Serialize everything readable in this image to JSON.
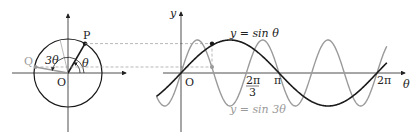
{
  "figure": {
    "circle": {
      "center": [
        68,
        73
      ],
      "radius": 34,
      "labels": {
        "P": "P",
        "Q": "Q",
        "O": "O",
        "theta": "θ",
        "three_theta": "3θ"
      }
    },
    "graph": {
      "origin": [
        181,
        73
      ],
      "x_scale_pi": 98,
      "amplitude": 33,
      "axis_labels": {
        "y": "y",
        "x": "θ",
        "origin": "O"
      },
      "ticks": {
        "two_pi_over_3_num": "2π",
        "two_pi_over_3_den": "3",
        "pi": "π",
        "two_pi": "2π"
      },
      "curve_labels": {
        "sin": "y = sin θ",
        "sin3": "y = sin 3θ"
      }
    },
    "colors": {
      "main": "#1a1a1a",
      "secondary": "#9a9a9a",
      "dashed": "#9a9a9a"
    }
  }
}
